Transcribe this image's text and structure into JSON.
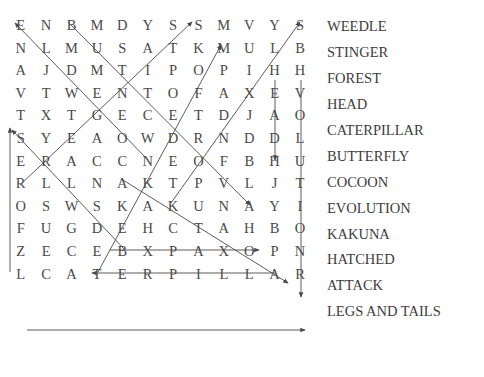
{
  "puzzle": {
    "title": "Word Search",
    "grid_rows": 12,
    "grid_cols": 12,
    "rows": [
      [
        "E",
        "N",
        "B",
        "M",
        "D",
        "Y",
        "S",
        "S",
        "M",
        "V",
        "Y",
        "S"
      ],
      [
        "N",
        "L",
        "M",
        "U",
        "S",
        "A",
        "T",
        "K",
        "M",
        "U",
        "L",
        "B"
      ],
      [
        "A",
        "J",
        "D",
        "M",
        "T",
        "I",
        "P",
        "O",
        "P",
        "I",
        "H",
        "H"
      ],
      [
        "V",
        "T",
        "W",
        "E",
        "N",
        "T",
        "O",
        "F",
        "A",
        "X",
        "E",
        "V"
      ],
      [
        "T",
        "X",
        "T",
        "G",
        "E",
        "C",
        "E",
        "T",
        "D",
        "J",
        "A",
        "O"
      ],
      [
        "S",
        "Y",
        "E",
        "A",
        "O",
        "W",
        "D",
        "R",
        "N",
        "D",
        "D",
        "L"
      ],
      [
        "E",
        "R",
        "A",
        "C",
        "C",
        "N",
        "E",
        "O",
        "F",
        "B",
        "H",
        "U"
      ],
      [
        "R",
        "L",
        "L",
        "N",
        "A",
        "K",
        "T",
        "P",
        "V",
        "L",
        "J",
        "T"
      ],
      [
        "O",
        "S",
        "W",
        "S",
        "K",
        "A",
        "K",
        "U",
        "N",
        "A",
        "Y",
        "I"
      ],
      [
        "F",
        "U",
        "G",
        "D",
        "E",
        "H",
        "C",
        "T",
        "A",
        "H",
        "B",
        "O"
      ],
      [
        "Z",
        "E",
        "C",
        "E",
        "B",
        "X",
        "P",
        "A",
        "X",
        "O",
        "P",
        "N"
      ],
      [
        "L",
        "C",
        "A",
        "T",
        "E",
        "R",
        "P",
        "I",
        "L",
        "L",
        "A",
        "R"
      ]
    ],
    "letter_color": "#4a4a4a",
    "marker_color": "#555555"
  },
  "word_list": {
    "label": "Words to find",
    "words": [
      {
        "text": "WEEDLE"
      },
      {
        "text": "STINGER"
      },
      {
        "text": "FOREST"
      },
      {
        "text": "HEAD"
      },
      {
        "text": "CATERPILLAR"
      },
      {
        "text": "BUTTERFLY"
      },
      {
        "text": "COCOON"
      },
      {
        "text": "EVOLUTION"
      },
      {
        "text": "KAKUNA"
      },
      {
        "text": "HATCHED"
      },
      {
        "text": "ATTACK"
      },
      {
        "text": "LEGS AND TAILS"
      }
    ]
  },
  "markers": [
    {
      "word": "CATERPILLAR",
      "direction": "horizontal-right"
    },
    {
      "word": "KAKUNA",
      "direction": "horizontal-right"
    },
    {
      "word": "HATCHED",
      "direction": "horizontal-left"
    },
    {
      "word": "FOREST",
      "direction": "vertical-up"
    },
    {
      "word": "HEAD",
      "direction": "vertical-down"
    },
    {
      "word": "EVOLUTION",
      "direction": "vertical-down"
    },
    {
      "word": "WEEDLE",
      "direction": "diagonal-up-left"
    },
    {
      "word": "STINGER",
      "direction": "diagonal-up-right"
    },
    {
      "word": "BUTTERFLY",
      "direction": "diagonal-down-right"
    },
    {
      "word": "COCOON",
      "direction": "diagonal-up-right"
    },
    {
      "word": "ATTACK",
      "direction": "diagonal-up-right"
    },
    {
      "word": "LEGS AND TAILS",
      "direction": "diagonal-down-right"
    }
  ]
}
